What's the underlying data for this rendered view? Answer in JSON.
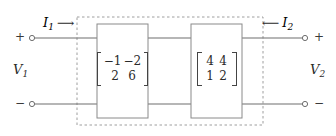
{
  "diagram": {
    "type": "cascaded-two-port-network",
    "enclosure": {
      "style": "dashed",
      "color": "#9a9a9a"
    },
    "wire_color": "#6e6e6e",
    "block_border_color": "#8a8a8a",
    "text_color": "#2a2a2a"
  },
  "ports": {
    "left": {
      "voltage_label": "V",
      "voltage_subscript": "1",
      "current_label": "I",
      "current_subscript": "1",
      "current_arrow": "⟶",
      "current_direction": "into-network",
      "top_polarity": "+",
      "bottom_polarity": "−"
    },
    "right": {
      "voltage_label": "V",
      "voltage_subscript": "2",
      "current_label": "I",
      "current_subscript": "2",
      "current_arrow": "⟵",
      "current_direction": "into-network",
      "top_polarity": "+",
      "bottom_polarity": "−"
    }
  },
  "blocks": [
    {
      "id": "block-1",
      "matrix": {
        "rows": [
          [
            "−1",
            "−2"
          ],
          [
            "2",
            "6"
          ]
        ],
        "bracket": "square",
        "align": "right"
      }
    },
    {
      "id": "block-2",
      "matrix": {
        "rows": [
          [
            "4",
            "4"
          ],
          [
            "1",
            "2"
          ]
        ],
        "bracket": "square",
        "align": "center"
      }
    }
  ]
}
